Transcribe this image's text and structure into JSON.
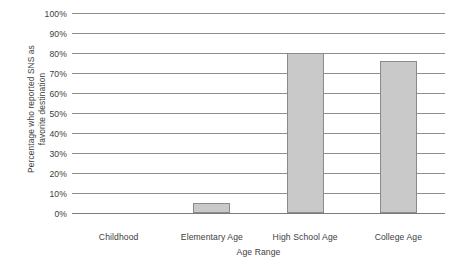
{
  "chart_data": {
    "type": "bar",
    "title": "",
    "subtitle": "",
    "xlabel": "Age Range",
    "ylabel": "Percentage who reported SNS as favorite destination",
    "ylabel_lines": [
      "Percentage who reported SNS as",
      "favorite destination"
    ],
    "categories": [
      "Childhood",
      "Elementary Age",
      "High School Age",
      "College Age"
    ],
    "values": [
      0,
      5,
      80,
      76
    ],
    "ylim": [
      0,
      100
    ],
    "ytick_values": [
      0,
      10,
      20,
      30,
      40,
      50,
      60,
      70,
      80,
      90,
      100
    ],
    "ytick_labels": [
      "0%",
      "10%",
      "20%",
      "30%",
      "40%",
      "50%",
      "60%",
      "70%",
      "80%",
      "90%",
      "100%"
    ],
    "grid": true,
    "grid_axis": "y",
    "legend": false,
    "legend_position": "none",
    "bar_fill_color": "#c9c9c9",
    "bar_border_color": "#8a8a8a",
    "gridline_color": "#8e8e8e",
    "axis_text_color": "#3d3d3d",
    "background_color": "#ffffff"
  }
}
